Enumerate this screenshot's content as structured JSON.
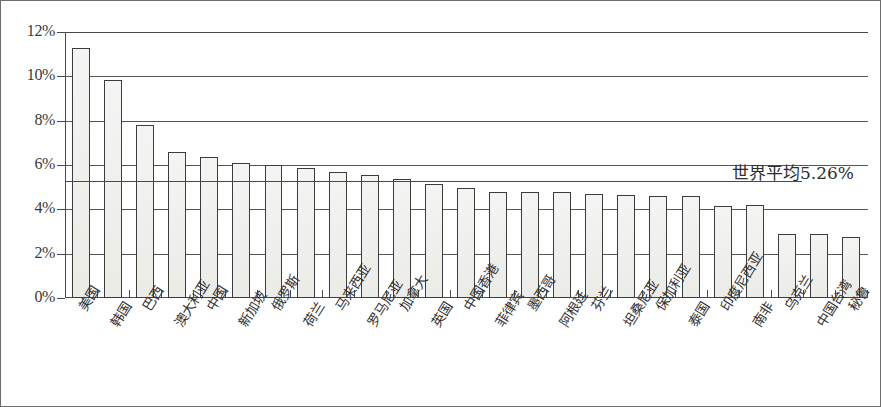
{
  "chart_data": {
    "type": "bar",
    "title": "",
    "subtitle": "",
    "xlabel": "",
    "ylabel": "",
    "ylim": [
      0,
      12
    ],
    "yticks": [
      "0%",
      "2%",
      "4%",
      "6%",
      "8%",
      "10%",
      "12%"
    ],
    "ytick_values": [
      0,
      2,
      4,
      6,
      8,
      10,
      12
    ],
    "grid": true,
    "legend": "none",
    "categories": [
      "美国",
      "韩国",
      "巴西",
      "澳大利亚",
      "中国",
      "新加坡",
      "俄罗斯",
      "荷兰",
      "马来西亚",
      "罗马尼亚",
      "加拿大",
      "英国",
      "中国香港",
      "菲律宾",
      "墨西哥",
      "阿根廷",
      "芬兰",
      "坦桑尼亚",
      "保加利亚",
      "泰国",
      "印度尼西亚",
      "南非",
      "乌克兰",
      "中国台湾",
      "秘鲁"
    ],
    "values": [
      11.3,
      9.85,
      7.8,
      6.6,
      6.35,
      6.1,
      6.0,
      5.85,
      5.7,
      5.55,
      5.35,
      5.15,
      4.95,
      4.8,
      4.8,
      4.8,
      4.7,
      4.65,
      4.6,
      4.6,
      4.15,
      4.2,
      2.9,
      2.9,
      2.75
    ],
    "annotations": [
      {
        "label": "世界平均",
        "value": "5.26%",
        "text": "世界平均5.26%",
        "y": 5.26,
        "type": "reference-line"
      }
    ],
    "colors": {
      "bar_fill": "#f2f2f0",
      "bar_stroke": "#3c3c3c",
      "axis": "#4a4a4a",
      "grid": "#555555",
      "text": "#2b2b2b",
      "frame": "#6d6d6d",
      "background": "#ffffff"
    }
  }
}
